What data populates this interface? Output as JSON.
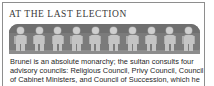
{
  "panel": {
    "title": "AT THE LAST ELECTION",
    "accent_color": "#7b7b7b",
    "border_color": "#8e8e8e",
    "text_color": "#1f1f1f"
  },
  "illustration": {
    "name": "row-of-people-figures",
    "figure_count": 10,
    "figure_color": "#c4c4c4",
    "head_color": "#cfcfcf",
    "band_color": "#7b7b7b"
  },
  "body": {
    "lines": [
      "Brunei is an absolute monarchy; the sultan consults four",
      "advisory councils: Religious Council, Privy Council, Council",
      "of Cabinet Ministers, and Council of Succession, which he"
    ]
  }
}
